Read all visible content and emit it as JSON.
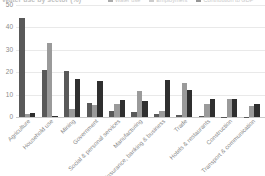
{
  "chart_data": {
    "type": "bar",
    "title": "Water use by sector (%)",
    "xlabel": "",
    "ylabel": "",
    "ylim": [
      0,
      50
    ],
    "yticks": [
      0,
      10,
      20,
      30,
      40,
      50
    ],
    "grid": true,
    "legend_position": "top-right",
    "categories": [
      "Agriculture",
      "Household use",
      "Mining",
      "Government",
      "Social & personal services",
      "Manufacturing",
      "Insurance, banking & business",
      "Trade",
      "Hotels & restaurants",
      "Construction",
      "Transport & communication"
    ],
    "series": [
      {
        "name": "Water use",
        "color": "#595959",
        "values": [
          44.2,
          21.0,
          20.4,
          6.4,
          2.5,
          2.1,
          1.2,
          0.9,
          0.5,
          0.2,
          0.2
        ]
      },
      {
        "name": "Employment",
        "color": "#9a9a9a",
        "values": [
          1.4,
          33.0,
          3.5,
          5.5,
          6.0,
          11.8,
          2.9,
          15.4,
          5.8,
          7.9,
          4.7
        ]
      },
      {
        "name": "Contribution to GDP",
        "color": "#2f2f2f",
        "values": [
          1.8,
          0.3,
          17.0,
          16.0,
          7.4,
          7.2,
          16.4,
          11.9,
          7.9,
          8.2,
          6.0
        ]
      }
    ]
  }
}
